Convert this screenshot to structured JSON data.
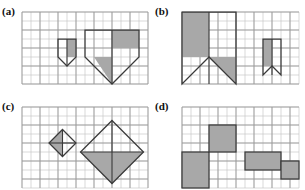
{
  "figure": {
    "type": "geometric-grid-figure",
    "panels": [
      {
        "id": "a",
        "label": "(a)"
      },
      {
        "id": "b",
        "label": "(b)"
      },
      {
        "id": "c",
        "label": "(c)"
      },
      {
        "id": "d",
        "label": "(d)"
      }
    ]
  },
  "colors": {
    "shade": "#a8a8a8",
    "outline": "#3a3a3a",
    "grid_minor": "#c9c9c9",
    "grid_major": "#9a9a9a",
    "background": "#ffffff",
    "text": "#101010"
  },
  "chart_data": {
    "type": "diagram",
    "title": "",
    "grid": {
      "cell_px": 9,
      "stroke": "#c9c9c9"
    },
    "panels": [
      {
        "id": "a",
        "label": "(a)",
        "grid_origin": [
          22,
          12
        ],
        "grid_cols": 14,
        "grid_rows": 8,
        "shapes": [
          {
            "name": "small-pennant",
            "kind": "polygon",
            "scale": 1,
            "points": [
              [
                4,
                3
              ],
              [
                6,
                3
              ],
              [
                6,
                5
              ],
              [
                5,
                6
              ],
              [
                4,
                5
              ]
            ],
            "shaded_parts": [
              [
                [
                  5,
                  3
                ],
                [
                  6,
                  3
                ],
                [
                  6,
                  5
                ],
                [
                  5,
                  5
                ]
              ]
            ]
          },
          {
            "name": "large-pennant",
            "kind": "polygon",
            "scale": 2,
            "points": [
              [
                7,
                2
              ],
              [
                13,
                2
              ],
              [
                13,
                5
              ],
              [
                10,
                8
              ],
              [
                7,
                5
              ]
            ],
            "shaded_parts": [
              [
                [
                  10,
                  2
                ],
                [
                  13,
                  2
                ],
                [
                  13,
                  4
                ],
                [
                  10,
                  4
                ]
              ],
              [
                [
                  8,
                  5
                ],
                [
                  10,
                  5
                ],
                [
                  10,
                  8
                ]
              ]
            ]
          }
        ]
      },
      {
        "id": "b",
        "label": "(b)",
        "grid_origin": [
          182,
          12
        ],
        "grid_cols": 13,
        "grid_rows": 8,
        "shapes": [
          {
            "name": "large-banner",
            "kind": "polygon",
            "scale": 2,
            "points": [
              [
                0,
                0
              ],
              [
                6,
                0
              ],
              [
                6,
                8
              ],
              [
                3,
                5
              ],
              [
                0,
                8
              ]
            ],
            "shaded_parts": [
              [
                [
                  0,
                  0
                ],
                [
                  3,
                  0
                ],
                [
                  3,
                  5
                ],
                [
                  0,
                  5
                ]
              ],
              [
                [
                  3,
                  5
                ],
                [
                  6,
                  5
                ],
                [
                  6,
                  8
                ]
              ]
            ]
          },
          {
            "name": "small-banner",
            "kind": "polygon",
            "scale": 1,
            "points": [
              [
                9,
                3
              ],
              [
                11,
                3
              ],
              [
                11,
                7
              ],
              [
                10,
                6
              ],
              [
                9,
                7
              ]
            ],
            "shaded_parts": [
              [
                [
                  9,
                  3
                ],
                [
                  10,
                  3
                ],
                [
                  10,
                  6
                ],
                [
                  9,
                  6
                ]
              ]
            ]
          }
        ]
      },
      {
        "id": "c",
        "label": "(c)",
        "grid_origin": [
          22,
          107
        ],
        "grid_cols": 14,
        "grid_rows": 9,
        "shapes": [
          {
            "name": "small-diamond",
            "kind": "rotated-square",
            "scale": 1,
            "center": [
              4.5,
              4
            ],
            "half_diagonal": 1.5,
            "shaded_quadrants": [
              "left",
              "bottom"
            ]
          },
          {
            "name": "large-diamond",
            "kind": "rotated-square",
            "scale": 2,
            "center": [
              10,
              5
            ],
            "half_diagonal": 3.5,
            "shaded_quadrants": [
              "right",
              "bottom"
            ]
          }
        ]
      },
      {
        "id": "d",
        "label": "(d)",
        "grid_origin": [
          182,
          107
        ],
        "grid_cols": 13,
        "grid_rows": 9,
        "shapes": [
          {
            "name": "left-block",
            "kind": "rect",
            "rect": [
              0,
              5,
              3,
              4
            ],
            "shaded": true
          },
          {
            "name": "tower-block",
            "kind": "rect",
            "rect": [
              3,
              2,
              3,
              3
            ],
            "shaded": true
          },
          {
            "name": "right-block",
            "kind": "rect",
            "rect": [
              7,
              5,
              4,
              2
            ],
            "shaded": true
          },
          {
            "name": "small-block",
            "kind": "rect",
            "rect": [
              11,
              6,
              2,
              2
            ],
            "shaded": true
          }
        ]
      }
    ]
  }
}
